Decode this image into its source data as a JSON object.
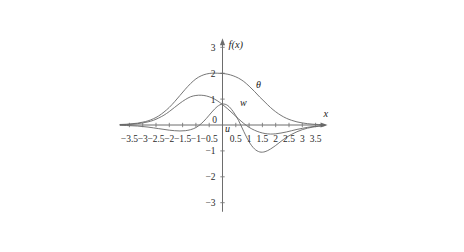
{
  "chart_data": {
    "type": "line",
    "title": "",
    "subtitle": "",
    "xlabel": "x",
    "ylabel": "f(x)",
    "xlim": [
      -3.85,
      3.95
    ],
    "ylim": [
      -3.35,
      3.35
    ],
    "grid": false,
    "legend_position": "inline-annotations",
    "x_ticks": [
      -3.5,
      -3,
      -2.5,
      -2,
      -1.5,
      -1,
      -0.5,
      0.5,
      1,
      1.5,
      2,
      2.5,
      3,
      3.5
    ],
    "x_tick_labels": [
      "−3.5",
      "−3",
      "−2.5",
      "−2",
      "−1.5",
      "−1",
      "−0.5",
      "0.5",
      "1",
      "1.5",
      "2",
      "2.5",
      "3",
      "3.5"
    ],
    "y_ticks": [
      -3,
      -2,
      -1,
      1,
      2,
      3
    ],
    "y_tick_labels": [
      "−3",
      "−2",
      "−1",
      "1",
      "2",
      "3"
    ],
    "origin_label": "0",
    "annotations": [
      {
        "text": "θ",
        "x": 1.35,
        "y": 1.42
      },
      {
        "text": "w",
        "x": 0.78,
        "y": 0.72
      },
      {
        "text": "u",
        "x": 0.19,
        "y": -0.28
      }
    ],
    "series": [
      {
        "name": "θ",
        "label": "θ",
        "color": "#666666",
        "x": [
          -3.85,
          -3.6,
          -3.4,
          -3.2,
          -3.0,
          -2.8,
          -2.6,
          -2.4,
          -2.2,
          -2.0,
          -1.8,
          -1.6,
          -1.4,
          -1.2,
          -1.0,
          -0.8,
          -0.6,
          -0.4,
          -0.2,
          0.0,
          0.2,
          0.4,
          0.6,
          0.8,
          1.0,
          1.2,
          1.4,
          1.6,
          1.8,
          2.0,
          2.2,
          2.4,
          2.6,
          2.8,
          3.0,
          3.2,
          3.4,
          3.6,
          3.85
        ],
        "y": [
          0.02,
          0.03,
          0.05,
          0.07,
          0.11,
          0.16,
          0.24,
          0.35,
          0.5,
          0.68,
          0.9,
          1.14,
          1.38,
          1.6,
          1.78,
          1.9,
          1.97,
          2.0,
          2.0,
          1.99,
          1.96,
          1.9,
          1.81,
          1.68,
          1.5,
          1.3,
          1.08,
          0.88,
          0.68,
          0.51,
          0.37,
          0.26,
          0.18,
          0.12,
          0.08,
          0.05,
          0.03,
          0.02,
          0.01
        ]
      },
      {
        "name": "w",
        "label": "w",
        "color": "#666666",
        "x": [
          -3.85,
          -3.6,
          -3.4,
          -3.2,
          -3.0,
          -2.8,
          -2.6,
          -2.4,
          -2.2,
          -2.0,
          -1.8,
          -1.6,
          -1.4,
          -1.2,
          -1.0,
          -0.8,
          -0.6,
          -0.4,
          -0.2,
          0.0,
          0.2,
          0.4,
          0.6,
          0.8,
          1.0,
          1.2,
          1.4,
          1.6,
          1.8,
          2.0,
          2.2,
          2.4,
          2.6,
          2.8,
          3.0,
          3.2,
          3.4,
          3.6,
          3.85
        ],
        "y": [
          0.01,
          0.02,
          0.03,
          0.05,
          0.08,
          0.12,
          0.18,
          0.27,
          0.38,
          0.52,
          0.68,
          0.84,
          0.98,
          1.09,
          1.14,
          1.15,
          1.12,
          1.05,
          0.94,
          0.79,
          0.62,
          0.43,
          0.24,
          0.06,
          -0.09,
          -0.2,
          -0.28,
          -0.33,
          -0.35,
          -0.34,
          -0.31,
          -0.27,
          -0.22,
          -0.17,
          -0.13,
          -0.09,
          -0.06,
          -0.04,
          -0.02
        ]
      },
      {
        "name": "u",
        "label": "u",
        "color": "#666666",
        "x": [
          -3.85,
          -3.6,
          -3.4,
          -3.2,
          -3.0,
          -2.8,
          -2.6,
          -2.4,
          -2.2,
          -2.0,
          -1.8,
          -1.6,
          -1.4,
          -1.2,
          -1.0,
          -0.8,
          -0.6,
          -0.4,
          -0.2,
          0.0,
          0.2,
          0.4,
          0.6,
          0.8,
          1.0,
          1.2,
          1.4,
          1.6,
          1.8,
          2.0,
          2.2,
          2.4,
          2.6,
          2.8,
          3.0,
          3.2,
          3.4,
          3.6,
          3.85
        ],
        "y": [
          -0.01,
          -0.02,
          -0.03,
          -0.04,
          -0.06,
          -0.08,
          -0.11,
          -0.14,
          -0.17,
          -0.2,
          -0.22,
          -0.23,
          -0.22,
          -0.18,
          -0.1,
          0.05,
          0.26,
          0.5,
          0.71,
          0.81,
          0.75,
          0.52,
          0.18,
          -0.25,
          -0.65,
          -0.92,
          -1.04,
          -1.03,
          -0.93,
          -0.79,
          -0.63,
          -0.48,
          -0.36,
          -0.26,
          -0.18,
          -0.12,
          -0.08,
          -0.05,
          -0.02
        ]
      }
    ]
  },
  "figure": {
    "axis_x_label": "x",
    "axis_y_label": "f(x)"
  }
}
